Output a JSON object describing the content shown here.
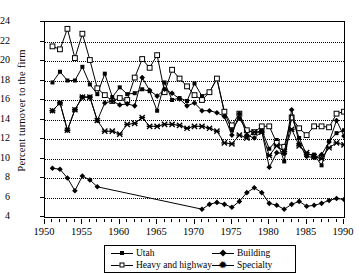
{
  "chart_data": {
    "type": "line",
    "title": "",
    "xlabel": "",
    "ylabel": "Percent turnover to the firm",
    "xlim": [
      1950,
      1990
    ],
    "ylim": [
      4,
      24
    ],
    "yticks": [
      4,
      6,
      8,
      10,
      12,
      14,
      16,
      18,
      20,
      22,
      24
    ],
    "xticks": [
      1950,
      1955,
      1960,
      1965,
      1970,
      1975,
      1980,
      1985,
      1990
    ],
    "xtick_minor_step": 1,
    "grid": "horizontal-dotted",
    "legend_position": "below-center",
    "series": [
      {
        "name": "Utah",
        "marker": "filled-square",
        "x": [
          1951,
          1952,
          1953,
          1954,
          1955,
          1956,
          1957,
          1958,
          1959,
          1960,
          1961,
          1962,
          1963,
          1964,
          1965,
          1966,
          1967,
          1968,
          1969,
          1970,
          1971,
          1972,
          1973,
          1974,
          1975,
          1976,
          1977,
          1978,
          1979,
          1980,
          1981,
          1982,
          1983,
          1984,
          1985,
          1986,
          1987,
          1988,
          1989,
          1990
        ],
        "y": [
          17.8,
          18.9,
          18.0,
          18.0,
          19.4,
          17.6,
          16.6,
          18.7,
          16.3,
          17.3,
          16.6,
          16.7,
          17.1,
          16.9,
          14.9,
          17.8,
          16.0,
          16.2,
          15.9,
          17.7,
          16.4,
          16.8,
          18.2,
          14.7,
          12.9,
          14.1,
          12.9,
          12.6,
          12.9,
          11.0,
          11.9,
          9.7,
          14.3,
          12.1,
          10.4,
          10.4,
          9.3,
          11.8,
          12.6,
          12.9
        ]
      },
      {
        "name": "Heavy and highway",
        "marker": "open-square",
        "x": [
          1951,
          1952,
          1953,
          1954,
          1955,
          1956,
          1957,
          1958,
          1959,
          1960,
          1961,
          1962,
          1963,
          1964,
          1965,
          1966,
          1967,
          1968,
          1969,
          1970,
          1971,
          1972,
          1973,
          1974,
          1975,
          1976,
          1977,
          1978,
          1979,
          1980,
          1981,
          1982,
          1983,
          1984,
          1985,
          1986,
          1987,
          1988,
          1989,
          1990
        ],
        "y": [
          21.5,
          21.2,
          23.3,
          20.3,
          22.8,
          20.1,
          17.2,
          16.5,
          15.9,
          16.2,
          16.0,
          18.3,
          20.2,
          19.3,
          20.6,
          16.8,
          19.1,
          18.2,
          17.4,
          16.5,
          16.0,
          16.8,
          18.2,
          14.8,
          13.4,
          14.6,
          12.9,
          12.7,
          13.3,
          13.3,
          11.6,
          11.2,
          14.2,
          13.1,
          12.4,
          13.3,
          13.3,
          13.2,
          14.6,
          14.8
        ]
      },
      {
        "name": "Building",
        "marker": "filled-diamond",
        "x": [
          1951,
          1952,
          1953,
          1954,
          1955,
          1956,
          1957,
          1971,
          1972,
          1973,
          1974,
          1975,
          1976,
          1977,
          1978,
          1979,
          1980,
          1981,
          1982,
          1983,
          1984,
          1985,
          1986,
          1987,
          1988,
          1989,
          1990
        ],
        "y": [
          9.0,
          8.9,
          8.0,
          6.7,
          8.2,
          7.8,
          7.1,
          4.8,
          5.3,
          5.5,
          5.3,
          5.0,
          5.6,
          6.5,
          7.0,
          6.5,
          5.4,
          5.2,
          4.8,
          5.3,
          5.6,
          5.1,
          5.2,
          5.4,
          5.7,
          5.9,
          5.8
        ]
      },
      {
        "name": "Building-upper",
        "marker": "filled-diamond",
        "x": [
          1951,
          1952,
          1953,
          1954,
          1955,
          1956,
          1957,
          1958,
          1959,
          1960,
          1961,
          1962,
          1963,
          1964,
          1965,
          1966,
          1967,
          1968,
          1969,
          1970,
          1971,
          1972,
          1973,
          1974,
          1975,
          1976,
          1977,
          1978,
          1979,
          1980,
          1981,
          1982,
          1983,
          1984,
          1985,
          1986,
          1987,
          1988,
          1989,
          1990
        ],
        "y": [
          14.9,
          15.7,
          12.9,
          15.0,
          16.3,
          16.3,
          13.9,
          15.7,
          15.9,
          15.5,
          15.6,
          15.4,
          18.3,
          17.0,
          16.4,
          17.1,
          16.7,
          16.1,
          15.4,
          15.7,
          14.9,
          14.9,
          14.7,
          14.3,
          12.4,
          14.6,
          12.4,
          12.1,
          12.8,
          9.1,
          10.6,
          10.5,
          15.0,
          11.5,
          10.2,
          10.1,
          10.4,
          11.7,
          13.9,
          12.3
        ]
      },
      {
        "name": "Specialty",
        "marker": "x-star",
        "x": [
          1951,
          1952,
          1953,
          1954,
          1955,
          1956,
          1957,
          1958,
          1959,
          1960,
          1961,
          1962,
          1963,
          1964,
          1965,
          1966,
          1967,
          1968,
          1969,
          1970,
          1971,
          1972,
          1973,
          1974,
          1975,
          1976,
          1977,
          1978,
          1979,
          1980,
          1981,
          1982,
          1983,
          1984,
          1985,
          1986,
          1987,
          1988,
          1989,
          1990
        ],
        "y": [
          14.9,
          15.7,
          12.9,
          15.0,
          16.3,
          16.3,
          13.9,
          12.8,
          12.8,
          12.5,
          13.5,
          13.6,
          14.2,
          13.3,
          13.3,
          13.5,
          13.5,
          13.4,
          13.1,
          13.3,
          13.3,
          13.1,
          12.8,
          11.6,
          11.5,
          12.4,
          12.1,
          12.7,
          12.7,
          10.3,
          11.3,
          10.7,
          13.0,
          11.3,
          10.6,
          10.2,
          10.0,
          11.1,
          11.6,
          11.4
        ]
      }
    ],
    "legend": [
      {
        "label": "Utah",
        "marker": "filled-square"
      },
      {
        "label": "Building",
        "marker": "filled-diamond"
      },
      {
        "label": "Heavy and highway",
        "marker": "open-square"
      },
      {
        "label": "Specialty",
        "marker": "x-star"
      }
    ]
  }
}
